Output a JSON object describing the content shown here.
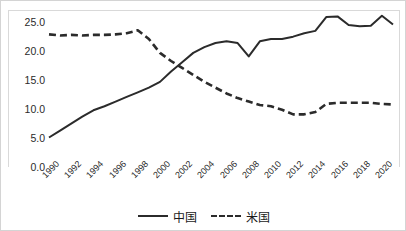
{
  "chart_data": {
    "type": "line",
    "title": "",
    "xlabel": "",
    "ylabel": "",
    "ylim": [
      0.0,
      27.0
    ],
    "yticks": [
      "0.0",
      "5.0",
      "10.0",
      "15.0",
      "20.0",
      "25.0"
    ],
    "ytick_values": [
      0.0,
      5.0,
      10.0,
      15.0,
      20.0,
      25.0
    ],
    "grid": false,
    "legend_position": "bottom-center",
    "x": [
      1990,
      1991,
      1992,
      1993,
      1994,
      1995,
      1996,
      1997,
      1998,
      1999,
      2000,
      2001,
      2002,
      2003,
      2004,
      2005,
      2006,
      2007,
      2008,
      2009,
      2010,
      2011,
      2012,
      2013,
      2014,
      2015,
      2016,
      2017,
      2018,
      2019,
      2020,
      2021
    ],
    "xtick_labels": [
      "1990",
      "1992",
      "1994",
      "1996",
      "1998",
      "2000",
      "2002",
      "2004",
      "2006",
      "2008",
      "2010",
      "2012",
      "2014",
      "2016",
      "2018",
      "2020"
    ],
    "series": [
      {
        "name": "中国",
        "style": "solid",
        "color": "#2b2b2b",
        "values": [
          5.0,
          6.2,
          7.4,
          8.6,
          9.7,
          10.4,
          11.2,
          12.0,
          12.8,
          13.6,
          14.6,
          16.4,
          18.0,
          19.6,
          20.6,
          21.3,
          21.6,
          21.3,
          19.0,
          21.6,
          22.0,
          22.0,
          22.4,
          23.0,
          23.4,
          25.8,
          25.9,
          24.4,
          24.2,
          24.3,
          26.0,
          24.5
        ]
      },
      {
        "name": "米国",
        "style": "dashed",
        "color": "#2b2b2b",
        "values": [
          22.8,
          22.6,
          22.7,
          22.6,
          22.7,
          22.7,
          22.8,
          23.0,
          23.5,
          22.0,
          19.6,
          18.2,
          17.0,
          15.8,
          14.6,
          13.6,
          12.6,
          11.8,
          11.2,
          10.6,
          10.4,
          9.8,
          9.0,
          9.0,
          9.4,
          10.8,
          11.0,
          11.0,
          11.0,
          11.0,
          10.8,
          10.7
        ]
      }
    ]
  },
  "legend": {
    "items": [
      {
        "label": "中国",
        "style": "solid"
      },
      {
        "label": "米国",
        "style": "dashed"
      }
    ]
  }
}
